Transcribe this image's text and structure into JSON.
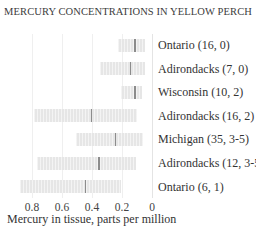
{
  "chart_data": {
    "type": "bar",
    "subtype": "range-bar-with-median",
    "title": "MERCURY CONCENTRATIONS IN YELLOW PERCH",
    "xlabel": "Mercury in tissue, parts per million",
    "ylabel": "",
    "x_axis_reversed": true,
    "xlim": [
      0,
      0.9
    ],
    "xticks": [
      "0.8",
      "0.6",
      "0.4",
      "0.2",
      "0"
    ],
    "grid": true,
    "legend": null,
    "categories": [
      "Ontario (16, 0)",
      "Adirondacks (7, 0)",
      "Wisconsin (10, 2)",
      "Adirondacks (16, 2)",
      "Michigan (35, 3-5)",
      "Adirondacks (12, 3-5)",
      "Ontario (6, 1)"
    ],
    "series": [
      {
        "name": "min",
        "values": [
          0.05,
          0.05,
          0.07,
          0.1,
          0.06,
          0.11,
          0.21
        ]
      },
      {
        "name": "median",
        "values": [
          0.12,
          0.15,
          0.12,
          0.41,
          0.25,
          0.36,
          0.45
        ]
      },
      {
        "name": "max",
        "values": [
          0.23,
          0.35,
          0.21,
          0.79,
          0.51,
          0.77,
          0.88
        ]
      }
    ]
  },
  "title": "MERCURY CONCENTRATIONS IN YELLOW PERCH",
  "xlabel": "Mercury in tissue, parts per million",
  "ticks": [
    {
      "label": "0.8",
      "value": 0.8
    },
    {
      "label": "0.6",
      "value": 0.6
    },
    {
      "label": "0.4",
      "value": 0.4
    },
    {
      "label": "0.2",
      "value": 0.2
    },
    {
      "label": "0",
      "value": 0
    }
  ],
  "rows": [
    {
      "label": "Ontario (16, 0)",
      "min": 0.05,
      "median": 0.12,
      "max": 0.23
    },
    {
      "label": "Adirondacks (7, 0)",
      "min": 0.05,
      "median": 0.15,
      "max": 0.35
    },
    {
      "label": "Wisconsin (10, 2)",
      "min": 0.07,
      "median": 0.12,
      "max": 0.21
    },
    {
      "label": "Adirondacks (16, 2)",
      "min": 0.1,
      "median": 0.41,
      "max": 0.79
    },
    {
      "label": "Michigan (35, 3-5)",
      "min": 0.06,
      "median": 0.25,
      "max": 0.51
    },
    {
      "label": "Adirondacks (12, 3-5)",
      "min": 0.11,
      "median": 0.36,
      "max": 0.77
    },
    {
      "label": "Ontario (6, 1)",
      "min": 0.21,
      "median": 0.45,
      "max": 0.88
    }
  ],
  "colors": {
    "bar": "#e6e6e6",
    "median": "#8c8c8c",
    "grid": "#efefef"
  }
}
